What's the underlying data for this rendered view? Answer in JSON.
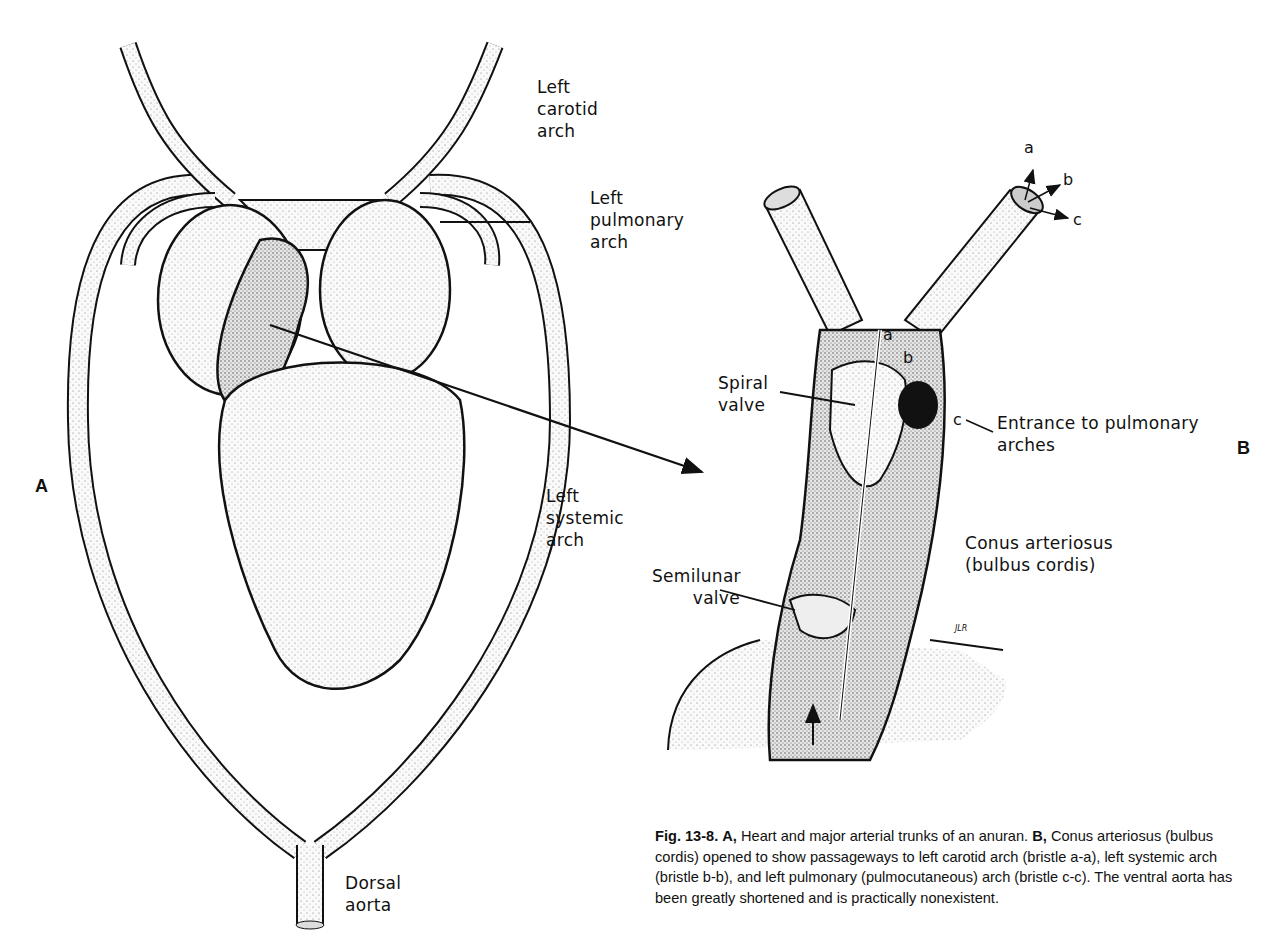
{
  "figure": {
    "panel_labels": {
      "A": "A",
      "B": "B"
    },
    "panel_a_labels": {
      "left_carotid_arch": "Left\ncarotid\narch",
      "left_pulmonary_arch": "Left\npulmonary\narch",
      "left_systemic_arch": "Left\nsystemic\narch",
      "dorsal_aorta": "Dorsal\naorta"
    },
    "panel_b_labels": {
      "spiral_valve": "Spiral\nvalve",
      "entrance_pulmonary": "Entrance to pulmonary\narches",
      "conus_arteriosus": "Conus arteriosus\n(bulbus cordis)",
      "semilunar_valve": "Semilunar\nvalve",
      "artist_initials": "JLR"
    },
    "bristles": {
      "a_top": "a",
      "b_top": "b",
      "c_top": "c",
      "a_inner": "a",
      "b_inner": "b",
      "c_inner": "c"
    },
    "caption": {
      "fig_number": "Fig. 13-8.",
      "part_a_marker": "A,",
      "part_a_text": "Heart and major arterial trunks of an anuran.",
      "part_b_marker": "B,",
      "part_b_text": "Conus arteriosus (bulbus cordis) opened to show passageways to left carotid arch (bristle a-a), left systemic arch (bristle b-b), and left pulmonary (pulmocutaneous) arch (bristle c-c). The ventral aorta has been greatly shortened and is practically nonexistent."
    }
  }
}
